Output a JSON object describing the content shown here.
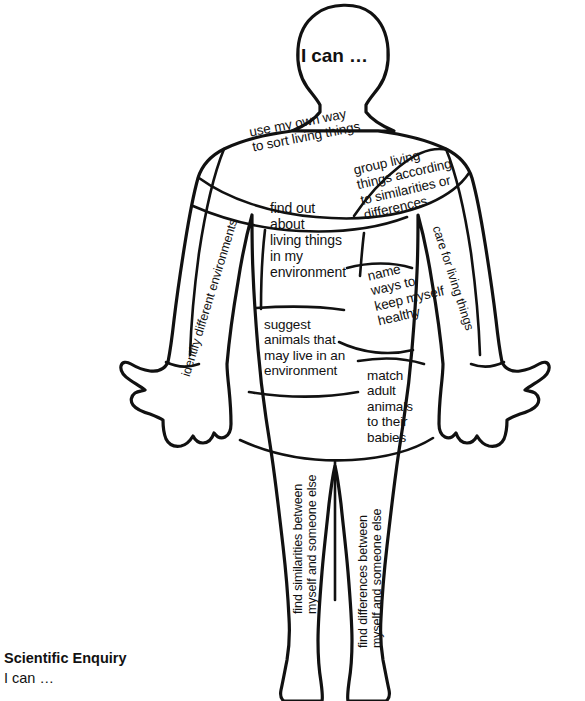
{
  "worksheet": {
    "head_label": "I can …",
    "footer": {
      "title": "Scientific Enquiry",
      "subtitle": "I can …"
    },
    "ink_color": "#111111",
    "paper_color": "#ffffff"
  },
  "body_regions": [
    {
      "id": "head",
      "name": "head",
      "text": "I can …"
    },
    {
      "id": "upper-chest",
      "name": "upper-chest",
      "text": "use my own way\nto sort living things"
    },
    {
      "id": "right-chest",
      "name": "right-chest",
      "text": "group living\nthings according\nto similarities or\ndifferences"
    },
    {
      "id": "left-torso",
      "name": "left-torso",
      "text": "find out\nabout\nliving things\nin my\nenvironment"
    },
    {
      "id": "left-arm",
      "name": "left-arm",
      "text": "identify different environments"
    },
    {
      "id": "right-arm",
      "name": "right-arm",
      "text": "care for living things"
    },
    {
      "id": "mid-torso",
      "name": "mid-torso",
      "text": "name\nways to\nkeep myself\nhealthy"
    },
    {
      "id": "lower-left-torso",
      "name": "lower-left-torso",
      "text": "suggest\nanimals that\nmay live in an\nenvironment"
    },
    {
      "id": "lower-right-torso",
      "name": "lower-right-torso",
      "text": "match\nadult\nanimals\nto their\nbabies"
    },
    {
      "id": "left-leg",
      "name": "left-leg",
      "text": "find similarities between\nmyself and someone else"
    },
    {
      "id": "right-leg",
      "name": "right-leg",
      "text": "find differences between\nmyself and someone else"
    }
  ]
}
